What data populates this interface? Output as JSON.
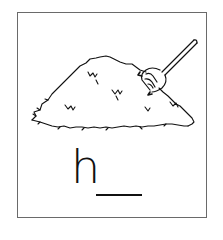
{
  "card": {
    "border_color": "#6a6a6a",
    "background": "#ffffff"
  },
  "illustration": {
    "subject": "haystack-with-pitchfork",
    "icons": [
      "haystack-icon",
      "pitchfork-icon"
    ]
  },
  "word": {
    "first_letter": "h",
    "blank": "__"
  }
}
